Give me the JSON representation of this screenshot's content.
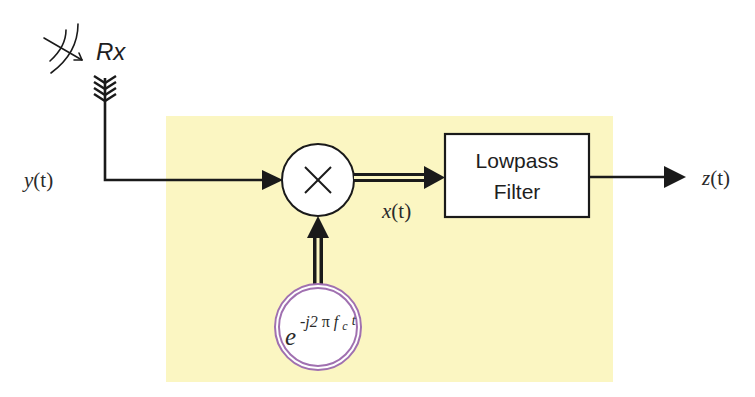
{
  "diagram": {
    "colors": {
      "background": "#ffffff",
      "highlight_region": "#fbf6c2",
      "line": "#1a1a1a",
      "oscillator_ring": "#a070b0",
      "block_fill": "#ffffff"
    },
    "antenna": {
      "label": "Rx",
      "icon": "antenna-icon",
      "wave_icon": "incoming-wave-icon"
    },
    "signals": {
      "input": {
        "fn": "y",
        "arg": "(t)"
      },
      "mixer_output": {
        "fn": "x",
        "arg": "(t)"
      },
      "output": {
        "fn": "z",
        "arg": "(t)"
      }
    },
    "mixer": {
      "symbol": "×",
      "icon": "multiplier-icon"
    },
    "oscillator": {
      "base": "e",
      "exponent_prefix": "-j2",
      "pi": "π",
      "f": "f",
      "subscript": "c",
      "t": "t"
    },
    "filter": {
      "line1": "Lowpass",
      "line2": "Filter"
    }
  }
}
